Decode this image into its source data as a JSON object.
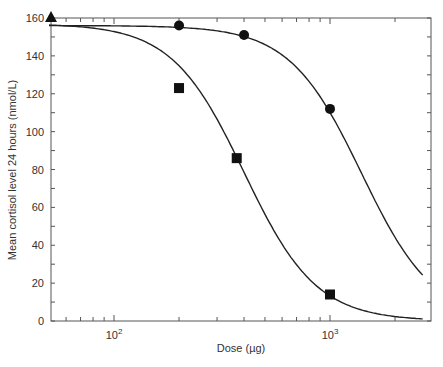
{
  "chart_data": {
    "type": "line",
    "title": "",
    "xlabel": "Dose (µg)",
    "ylabel": "Mean cortisol level 24 hours (nmol/L)",
    "xscale": "log",
    "xlim": [
      50,
      3000
    ],
    "ylim": [
      0,
      160
    ],
    "yticks": [
      0,
      20,
      40,
      60,
      80,
      100,
      120,
      140,
      160
    ],
    "xticks_major": [
      {
        "value": 100,
        "base": "10",
        "exp": "2"
      },
      {
        "value": 1000,
        "base": "10",
        "exp": "3"
      }
    ],
    "grid": false,
    "legend": null,
    "series": [
      {
        "name": "circles",
        "marker": "circle",
        "points": [
          {
            "x": 200,
            "y": 156
          },
          {
            "x": 400,
            "y": 151
          },
          {
            "x": 1000,
            "y": 112
          }
        ],
        "fit": {
          "top": 156,
          "ec50": 1400,
          "hill": 2.6,
          "x_end": 2700
        }
      },
      {
        "name": "squares",
        "marker": "square",
        "points": [
          {
            "x": 200,
            "y": 123
          },
          {
            "x": 370,
            "y": 86
          },
          {
            "x": 1000,
            "y": 14
          }
        ],
        "fit": {
          "top": 157,
          "ec50": 400,
          "hill": 2.6,
          "x_end": 2700
        }
      },
      {
        "name": "triangle",
        "marker": "triangle",
        "points": [
          {
            "x": 50,
            "y": 160
          }
        ]
      }
    ]
  }
}
